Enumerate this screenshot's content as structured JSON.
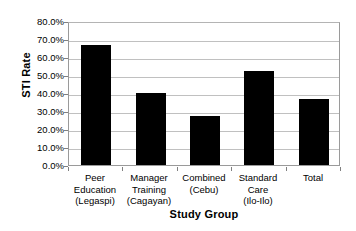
{
  "chart_data": {
    "type": "bar",
    "title": "",
    "xlabel": "Study Group",
    "ylabel": "STI Rate",
    "categories": [
      "Peer Education (Legaspi)",
      "Manager Training (Cagayan)",
      "Combined (Cebu)",
      "Standard Care (Ilo-Ilo)",
      "Total"
    ],
    "category_lines": [
      [
        "Peer",
        "Education",
        "(Legaspi)"
      ],
      [
        "Manager",
        "Training",
        "(Cagayan)"
      ],
      [
        "Combined",
        "(Cebu)"
      ],
      [
        "Standard",
        "Care",
        "(Ilo-Ilo)"
      ],
      [
        "Total"
      ]
    ],
    "values": [
      0.665,
      0.4,
      0.27,
      0.52,
      0.365
    ],
    "value_labels": [
      "66.5%",
      "40.0%",
      "27.0%",
      "52.0%",
      "36.5%"
    ],
    "ylim": [
      0.0,
      0.8
    ],
    "ytick_values": [
      0.8,
      0.7,
      0.6,
      0.5,
      0.4,
      0.3,
      0.2,
      0.1,
      0.0
    ],
    "ytick_labels": [
      "80.0%",
      "70.0%",
      "60.0%",
      "50.0%",
      "40.0%",
      "30.0%",
      "20.0%",
      "10.0%",
      "0.0%"
    ],
    "grid": true,
    "grid_axis": "y",
    "legend": false,
    "legend_position": "none",
    "bar_color": "#000000",
    "grid_color": "#c0c0c0",
    "axis_color": "#9a9a9a",
    "plot_background": "#ffffff",
    "figure_background": "#ffffff"
  }
}
